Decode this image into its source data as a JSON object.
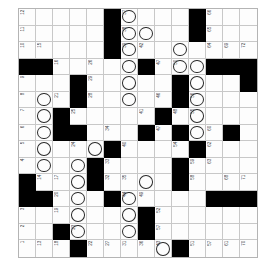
{
  "puzzle": {
    "kind": "crossword-grid",
    "orientation": "numbers-rotated-90",
    "columns": 14,
    "rows": 14,
    "cell_size_px": 17,
    "colors": {
      "block": "#000000",
      "open": "#fdfdfd",
      "gridline": "#c8c8c8",
      "border": "#b4b4b4",
      "number_text": "#444444",
      "circle_stroke": "#2a2a2a"
    },
    "side_note": "",
    "cells": [
      [
        {
          "n": "12"
        },
        {},
        {},
        {},
        {},
        {
          "b": true
        },
        {
          "n": "37",
          "c": true
        },
        {},
        {},
        {},
        {
          "b": true
        },
        {
          "n": "66"
        },
        {},
        {}
      ],
      [
        {
          "n": "11"
        },
        {},
        {},
        {},
        {},
        {
          "b": true
        },
        {
          "n": "38",
          "c": true
        },
        {
          "c": true
        },
        {},
        {},
        {
          "b": true
        },
        {
          "n": "65"
        },
        {},
        {}
      ],
      [
        {
          "n": "10"
        },
        {
          "n": "15"
        },
        {},
        {},
        {},
        {
          "b": true
        },
        {
          "n": "39",
          "c": true
        },
        {
          "n": "42"
        },
        {},
        {
          "c": true
        },
        {},
        {
          "n": "64"
        },
        {
          "n": "69"
        },
        {
          "n": "72"
        }
      ],
      [
        {
          "b": true
        },
        {
          "b": true
        },
        {
          "n": "16"
        },
        {},
        {
          "n": "26"
        },
        {},
        {
          "c": true
        },
        {
          "b": true
        },
        {
          "n": "47"
        },
        {
          "n": "50",
          "c": true
        },
        {
          "c": true
        },
        {
          "b": true
        },
        {
          "b": true
        },
        {
          "b": true
        }
      ],
      [
        {
          "n": "9"
        },
        {},
        {},
        {
          "b": true
        },
        {
          "n": "29"
        },
        {},
        {
          "c": true
        },
        {},
        {},
        {
          "b": true
        },
        {
          "c": true
        },
        {},
        {},
        {
          "b": true
        }
      ],
      [
        {
          "n": "8"
        },
        {
          "c": true
        },
        {
          "n": "21"
        },
        {
          "b": true
        },
        {
          "n": "28"
        },
        {},
        {
          "c": true
        },
        {},
        {
          "n": "46"
        },
        {
          "b": true
        },
        {
          "n": "56",
          "c": true
        },
        {},
        {},
        {}
      ],
      [
        {
          "n": "7"
        },
        {
          "c": true
        },
        {
          "b": true
        },
        {
          "n": "25"
        },
        {},
        {},
        {},
        {
          "n": "41"
        },
        {
          "b": true
        },
        {
          "n": "48"
        },
        {
          "n": "55",
          "c": true
        },
        {},
        {},
        {}
      ],
      [
        {
          "n": "6"
        },
        {
          "c": true
        },
        {
          "b": true
        },
        {
          "b": true
        },
        {},
        {
          "n": "34"
        },
        {},
        {
          "b": true
        },
        {
          "n": "47"
        },
        {
          "b": true
        },
        {
          "c": true
        },
        {
          "n": "60"
        },
        {
          "b": true
        },
        {}
      ],
      [
        {
          "n": "5"
        },
        {
          "c": true
        },
        {},
        {
          "n": "24"
        },
        {
          "c": true
        },
        {
          "b": true
        },
        {
          "n": "40"
        },
        {},
        {},
        {
          "n": "54"
        },
        {
          "b": true
        },
        {
          "n": "62"
        },
        {},
        {}
      ],
      [
        {
          "n": "4"
        },
        {
          "c": true
        },
        {},
        {
          "c": true
        },
        {
          "b": true
        },
        {
          "n": "33"
        },
        {},
        {},
        {},
        {
          "b": true
        },
        {
          "n": "59"
        },
        {
          "n": "63"
        },
        {},
        {}
      ],
      [
        {
          "b": true
        },
        {
          "n": "14"
        },
        {
          "n": "17"
        },
        {
          "c": true
        },
        {
          "b": true
        },
        {
          "n": "32"
        },
        {
          "n": "35"
        },
        {
          "c": true
        },
        {},
        {
          "b": true
        },
        {
          "n": "58"
        },
        {},
        {
          "n": "68"
        },
        {
          "n": "71"
        }
      ],
      [
        {
          "b": true
        },
        {
          "b": true
        },
        {
          "n": "20"
        },
        {
          "c": true
        },
        {},
        {
          "b": true
        },
        {
          "n": "44",
          "c": true
        },
        {
          "n": "49"
        },
        {},
        {},
        {},
        {
          "b": true
        },
        {
          "b": true
        },
        {
          "b": true
        }
      ],
      [
        {
          "n": "3"
        },
        {},
        {
          "n": "19"
        },
        {
          "c": true
        },
        {},
        {},
        {
          "c": true
        },
        {
          "b": true
        },
        {
          "n": "52"
        },
        {},
        {},
        {},
        {},
        {}
      ],
      [
        {
          "n": "2"
        },
        {},
        {
          "b": true
        },
        {
          "n": "23",
          "c": true
        },
        {},
        {},
        {
          "c": true
        },
        {
          "b": true
        },
        {
          "n": "57"
        },
        {},
        {},
        {},
        {},
        {}
      ],
      [
        {
          "n": "1"
        },
        {
          "n": "13"
        },
        {
          "n": "18"
        },
        {
          "b": true
        },
        {
          "n": "22"
        },
        {
          "n": "27"
        },
        {
          "n": "31"
        },
        {
          "n": "36"
        },
        {
          "n": "43",
          "c": true
        },
        {
          "b": true
        },
        {
          "n": "51"
        },
        {
          "n": "57"
        },
        {
          "n": "61"
        },
        {
          "n": "70"
        }
      ]
    ]
  }
}
